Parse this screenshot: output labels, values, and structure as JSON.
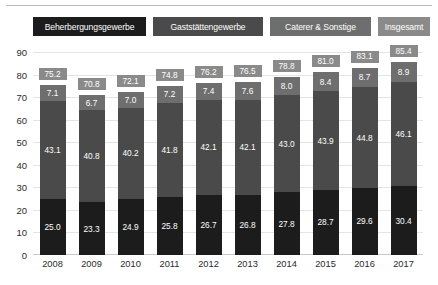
{
  "chart_data": {
    "type": "bar",
    "subtype": "stacked-bar",
    "title": "",
    "xlabel": "",
    "ylabel": "",
    "ylim": [
      0,
      90
    ],
    "ytick_step": 10,
    "yticks": [
      "90",
      "80",
      "70",
      "60",
      "50",
      "40",
      "30",
      "20",
      "10",
      "0"
    ],
    "grid": true,
    "legend_position": "top",
    "categories": [
      "2008",
      "2009",
      "2010",
      "2011",
      "2012",
      "2013",
      "2014",
      "2015",
      "2016",
      "2017"
    ],
    "series": [
      {
        "name": "Beherbergungsgewerbe",
        "color": "#1c1c1c",
        "values": [
          25.0,
          23.3,
          24.9,
          25.8,
          26.7,
          26.8,
          27.8,
          28.7,
          29.6,
          30.4
        ],
        "labels": [
          "25.0",
          "23.3",
          "24.9",
          "25.8",
          "26.7",
          "26.8",
          "27.8",
          "28.7",
          "29.6",
          "30.4"
        ]
      },
      {
        "name": "Gaststättengewerbe",
        "color": "#4a4a4a",
        "values": [
          43.1,
          40.8,
          40.2,
          41.8,
          42.1,
          42.1,
          43.0,
          43.9,
          44.8,
          46.1
        ],
        "labels": [
          "43.1",
          "40.8",
          "40.2",
          "41.8",
          "42.1",
          "42.1",
          "43.0",
          "43.9",
          "44.8",
          "46.1"
        ]
      },
      {
        "name": "Caterer & Sonstige",
        "color": "#6e6e6e",
        "values": [
          7.1,
          6.7,
          7.0,
          7.2,
          7.4,
          7.6,
          8.0,
          8.4,
          8.7,
          8.9
        ],
        "labels": [
          "7.1",
          "6.7",
          "7.0",
          "7.2",
          "7.4",
          "7.6",
          "8.0",
          "8.4",
          "8.7",
          "8.9"
        ]
      }
    ],
    "totals": {
      "name": "Insgesamt",
      "color": "#8a8a8a",
      "values": [
        75.2,
        70.8,
        72.1,
        74.8,
        76.2,
        76.5,
        78.8,
        81.0,
        83.1,
        85.4
      ],
      "labels": [
        "75.2",
        "70.8",
        "72.1",
        "74.8",
        "76.2",
        "76.5",
        "78.8",
        "81.0",
        "83.1",
        "85.4"
      ]
    }
  },
  "legend": {
    "items": [
      {
        "label": "Beherbergungsgewerbe",
        "color": "#1c1c1c"
      },
      {
        "label": "Gaststättengewerbe",
        "color": "#4a4a4a"
      },
      {
        "label": "Caterer & Sonstige",
        "color": "#6e6e6e"
      },
      {
        "label": "Insgesamt",
        "color": "#8a8a8a"
      }
    ]
  }
}
